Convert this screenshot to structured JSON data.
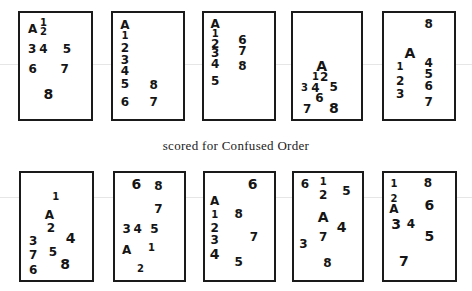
{
  "caption": "scored for Confused Order",
  "rows": [
    {
      "cards": [
        {
          "glyphs": [
            {
              "t": "A",
              "x": 0.18,
              "y": 0.15,
              "s": "md"
            },
            {
              "t": "1",
              "x": 0.33,
              "y": 0.09,
              "s": "sm"
            },
            {
              "t": "2",
              "x": 0.33,
              "y": 0.18,
              "s": "sm"
            },
            {
              "t": "3",
              "x": 0.17,
              "y": 0.34,
              "s": "md"
            },
            {
              "t": "4",
              "x": 0.33,
              "y": 0.34,
              "s": "md"
            },
            {
              "t": "5",
              "x": 0.66,
              "y": 0.34,
              "s": "md"
            },
            {
              "t": "6",
              "x": 0.18,
              "y": 0.53,
              "s": "md"
            },
            {
              "t": "7",
              "x": 0.63,
              "y": 0.53,
              "s": "md"
            },
            {
              "t": "8",
              "x": 0.4,
              "y": 0.76,
              "s": "lg"
            }
          ]
        },
        {
          "glyphs": [
            {
              "t": "A",
              "x": 0.17,
              "y": 0.11,
              "s": "md"
            },
            {
              "t": "1",
              "x": 0.17,
              "y": 0.22,
              "s": "sm"
            },
            {
              "t": "2",
              "x": 0.17,
              "y": 0.33,
              "s": "md"
            },
            {
              "t": "3",
              "x": 0.17,
              "y": 0.44,
              "s": "md"
            },
            {
              "t": "4",
              "x": 0.17,
              "y": 0.55,
              "s": "md"
            },
            {
              "t": "5",
              "x": 0.17,
              "y": 0.67,
              "s": "md"
            },
            {
              "t": "8",
              "x": 0.58,
              "y": 0.68,
              "s": "md"
            },
            {
              "t": "6",
              "x": 0.17,
              "y": 0.84,
              "s": "md"
            },
            {
              "t": "7",
              "x": 0.58,
              "y": 0.84,
              "s": "md"
            }
          ]
        },
        {
          "glyphs": [
            {
              "t": "A",
              "x": 0.16,
              "y": 0.1,
              "s": "md"
            },
            {
              "t": "1",
              "x": 0.16,
              "y": 0.2,
              "s": "sm"
            },
            {
              "t": "2",
              "x": 0.16,
              "y": 0.29,
              "s": "md"
            },
            {
              "t": "3",
              "x": 0.16,
              "y": 0.38,
              "s": "md"
            },
            {
              "t": "4",
              "x": 0.16,
              "y": 0.48,
              "s": "md"
            },
            {
              "t": "5",
              "x": 0.16,
              "y": 0.64,
              "s": "md"
            },
            {
              "t": "6",
              "x": 0.55,
              "y": 0.25,
              "s": "md"
            },
            {
              "t": "7",
              "x": 0.55,
              "y": 0.36,
              "s": "md"
            },
            {
              "t": "8",
              "x": 0.55,
              "y": 0.5,
              "s": "md"
            }
          ]
        },
        {
          "glyphs": [
            {
              "t": "A",
              "x": 0.42,
              "y": 0.5,
              "s": "lg"
            },
            {
              "t": "1",
              "x": 0.33,
              "y": 0.6,
              "s": "sm"
            },
            {
              "t": "2",
              "x": 0.46,
              "y": 0.6,
              "s": "md"
            },
            {
              "t": "3",
              "x": 0.17,
              "y": 0.71,
              "s": "sm"
            },
            {
              "t": "4",
              "x": 0.33,
              "y": 0.71,
              "s": "md"
            },
            {
              "t": "5",
              "x": 0.6,
              "y": 0.7,
              "s": "md"
            },
            {
              "t": "6",
              "x": 0.39,
              "y": 0.8,
              "s": "md"
            },
            {
              "t": "7",
              "x": 0.21,
              "y": 0.91,
              "s": "md"
            },
            {
              "t": "8",
              "x": 0.6,
              "y": 0.9,
              "s": "lg"
            }
          ]
        },
        {
          "glyphs": [
            {
              "t": "8",
              "x": 0.64,
              "y": 0.1,
              "s": "md"
            },
            {
              "t": "A",
              "x": 0.37,
              "y": 0.38,
              "s": "lg"
            },
            {
              "t": "1",
              "x": 0.23,
              "y": 0.51,
              "s": "sm"
            },
            {
              "t": "4",
              "x": 0.64,
              "y": 0.47,
              "s": "md"
            },
            {
              "t": "2",
              "x": 0.23,
              "y": 0.64,
              "s": "md"
            },
            {
              "t": "5",
              "x": 0.64,
              "y": 0.58,
              "s": "md"
            },
            {
              "t": "6",
              "x": 0.64,
              "y": 0.69,
              "s": "md"
            },
            {
              "t": "3",
              "x": 0.23,
              "y": 0.76,
              "s": "md"
            },
            {
              "t": "7",
              "x": 0.64,
              "y": 0.84,
              "s": "md"
            }
          ]
        }
      ]
    },
    {
      "cards": [
        {
          "glyphs": [
            {
              "t": "1",
              "x": 0.49,
              "y": 0.22,
              "s": "sm"
            },
            {
              "t": "A",
              "x": 0.4,
              "y": 0.39,
              "s": "md"
            },
            {
              "t": "2",
              "x": 0.42,
              "y": 0.51,
              "s": "md"
            },
            {
              "t": "3",
              "x": 0.17,
              "y": 0.64,
              "s": "md"
            },
            {
              "t": "4",
              "x": 0.7,
              "y": 0.61,
              "s": "lg"
            },
            {
              "t": "5",
              "x": 0.45,
              "y": 0.74,
              "s": "md"
            },
            {
              "t": "7",
              "x": 0.17,
              "y": 0.77,
              "s": "md"
            },
            {
              "t": "8",
              "x": 0.62,
              "y": 0.85,
              "s": "lg"
            },
            {
              "t": "6",
              "x": 0.17,
              "y": 0.91,
              "s": "md"
            }
          ]
        },
        {
          "glyphs": [
            {
              "t": "6",
              "x": 0.31,
              "y": 0.1,
              "s": "lg"
            },
            {
              "t": "8",
              "x": 0.63,
              "y": 0.12,
              "s": "md"
            },
            {
              "t": "7",
              "x": 0.63,
              "y": 0.34,
              "s": "md"
            },
            {
              "t": "3",
              "x": 0.17,
              "y": 0.52,
              "s": "md"
            },
            {
              "t": "4",
              "x": 0.33,
              "y": 0.52,
              "s": "md"
            },
            {
              "t": "5",
              "x": 0.57,
              "y": 0.52,
              "s": "md"
            },
            {
              "t": "A",
              "x": 0.17,
              "y": 0.72,
              "s": "md"
            },
            {
              "t": "1",
              "x": 0.53,
              "y": 0.7,
              "s": "sm"
            },
            {
              "t": "2",
              "x": 0.37,
              "y": 0.9,
              "s": "sm"
            }
          ]
        },
        {
          "glyphs": [
            {
              "t": "6",
              "x": 0.69,
              "y": 0.1,
              "s": "lg"
            },
            {
              "t": "A",
              "x": 0.14,
              "y": 0.26,
              "s": "md"
            },
            {
              "t": "1",
              "x": 0.14,
              "y": 0.39,
              "s": "sm"
            },
            {
              "t": "8",
              "x": 0.49,
              "y": 0.38,
              "s": "md"
            },
            {
              "t": "2",
              "x": 0.14,
              "y": 0.51,
              "s": "md"
            },
            {
              "t": "3",
              "x": 0.14,
              "y": 0.63,
              "s": "md"
            },
            {
              "t": "7",
              "x": 0.71,
              "y": 0.6,
              "s": "md"
            },
            {
              "t": "4",
              "x": 0.14,
              "y": 0.76,
              "s": "lg"
            },
            {
              "t": "5",
              "x": 0.49,
              "y": 0.83,
              "s": "md"
            }
          ]
        },
        {
          "glyphs": [
            {
              "t": "6",
              "x": 0.16,
              "y": 0.1,
              "s": "md"
            },
            {
              "t": "1",
              "x": 0.43,
              "y": 0.08,
              "s": "sm"
            },
            {
              "t": "2",
              "x": 0.43,
              "y": 0.21,
              "s": "md"
            },
            {
              "t": "5",
              "x": 0.77,
              "y": 0.17,
              "s": "md"
            },
            {
              "t": "A",
              "x": 0.43,
              "y": 0.41,
              "s": "lg"
            },
            {
              "t": "4",
              "x": 0.7,
              "y": 0.5,
              "s": "lg"
            },
            {
              "t": "7",
              "x": 0.43,
              "y": 0.6,
              "s": "md"
            },
            {
              "t": "3",
              "x": 0.14,
              "y": 0.66,
              "s": "md"
            },
            {
              "t": "8",
              "x": 0.49,
              "y": 0.84,
              "s": "md"
            }
          ]
        },
        {
          "glyphs": [
            {
              "t": "1",
              "x": 0.14,
              "y": 0.1,
              "s": "sm"
            },
            {
              "t": "8",
              "x": 0.62,
              "y": 0.09,
              "s": "md"
            },
            {
              "t": "2",
              "x": 0.14,
              "y": 0.24,
              "s": "sm"
            },
            {
              "t": "6",
              "x": 0.64,
              "y": 0.3,
              "s": "lg"
            },
            {
              "t": "A",
              "x": 0.14,
              "y": 0.34,
              "s": "md"
            },
            {
              "t": "3",
              "x": 0.17,
              "y": 0.48,
              "s": "lg"
            },
            {
              "t": "4",
              "x": 0.38,
              "y": 0.48,
              "s": "md"
            },
            {
              "t": "5",
              "x": 0.64,
              "y": 0.59,
              "s": "lg"
            },
            {
              "t": "7",
              "x": 0.28,
              "y": 0.82,
              "s": "lg"
            }
          ]
        }
      ]
    }
  ]
}
